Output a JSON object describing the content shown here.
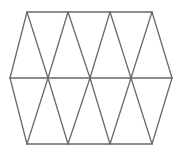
{
  "figure": {
    "canvas": {
      "width": 183,
      "height": 153
    },
    "colors": {
      "background": "#ffffff",
      "stroke": "#6a6a6a",
      "fill": "#ffffff"
    },
    "stroke_width": 1.3,
    "geometry": {
      "rows": {
        "top_y": 12,
        "middle_y": 78,
        "bottom_y": 144
      },
      "top_vertices_x": [
        27,
        68,
        110,
        152
      ],
      "middle_vertices_x": [
        10,
        48,
        90,
        131,
        172
      ],
      "bottom_vertices_x": [
        27,
        68,
        110,
        152
      ]
    },
    "points": {
      "T0": [
        27,
        12
      ],
      "T1": [
        68,
        12
      ],
      "T2": [
        110,
        12
      ],
      "T3": [
        152,
        12
      ],
      "M0": [
        10,
        78
      ],
      "M1": [
        48,
        78
      ],
      "M2": [
        90,
        78
      ],
      "M3": [
        131,
        78
      ],
      "M4": [
        172,
        78
      ],
      "B0": [
        27,
        144
      ],
      "B1": [
        68,
        144
      ],
      "B2": [
        110,
        144
      ],
      "B3": [
        152,
        144
      ]
    },
    "triangles": [
      {
        "name": "top-left-half",
        "pts": "27,12 10,78 48,78"
      },
      {
        "name": "top-up-1",
        "pts": "27,12 48,78 68,12"
      },
      {
        "name": "top-down-1",
        "pts": "68,12 48,78 90,78"
      },
      {
        "name": "top-up-2",
        "pts": "68,12 90,78 110,12"
      },
      {
        "name": "top-down-2",
        "pts": "110,12 90,78 131,78"
      },
      {
        "name": "top-up-3",
        "pts": "110,12 131,78 152,12"
      },
      {
        "name": "top-right-half",
        "pts": "152,12 131,78 172,78"
      },
      {
        "name": "bottom-left-half",
        "pts": "27,144 10,78 48,78"
      },
      {
        "name": "bottom-up-1",
        "pts": "27,144 48,78 68,144"
      },
      {
        "name": "bottom-down-1",
        "pts": "68,144 48,78 90,78"
      },
      {
        "name": "bottom-up-2",
        "pts": "68,144 90,78 110,144"
      },
      {
        "name": "bottom-down-2",
        "pts": "110,144 90,78 131,78"
      },
      {
        "name": "bottom-up-3",
        "pts": "110,144 131,78 152,144"
      },
      {
        "name": "bottom-right-half",
        "pts": "152,144 131,78 172,78"
      }
    ],
    "edges": [
      {
        "name": "outline-top",
        "x1": 27,
        "y1": 12,
        "x2": 152,
        "y2": 12
      },
      {
        "name": "outline-bottom",
        "x1": 27,
        "y1": 144,
        "x2": 152,
        "y2": 144
      },
      {
        "name": "outline-upper-left",
        "x1": 27,
        "y1": 12,
        "x2": 10,
        "y2": 78
      },
      {
        "name": "outline-lower-left",
        "x1": 10,
        "y1": 78,
        "x2": 27,
        "y2": 144
      },
      {
        "name": "outline-upper-right",
        "x1": 152,
        "y1": 12,
        "x2": 172,
        "y2": 78
      },
      {
        "name": "outline-lower-right",
        "x1": 172,
        "y1": 78,
        "x2": 152,
        "y2": 144
      },
      {
        "name": "midline-horizontal",
        "x1": 10,
        "y1": 78,
        "x2": 172,
        "y2": 78
      },
      {
        "name": "top-diag-down-1",
        "x1": 27,
        "y1": 12,
        "x2": 48,
        "y2": 78
      },
      {
        "name": "top-diag-up-1",
        "x1": 48,
        "y1": 78,
        "x2": 68,
        "y2": 12
      },
      {
        "name": "top-diag-down-2",
        "x1": 68,
        "y1": 12,
        "x2": 90,
        "y2": 78
      },
      {
        "name": "top-diag-up-2",
        "x1": 90,
        "y1": 78,
        "x2": 110,
        "y2": 12
      },
      {
        "name": "top-diag-down-3",
        "x1": 110,
        "y1": 12,
        "x2": 131,
        "y2": 78
      },
      {
        "name": "top-diag-up-3",
        "x1": 131,
        "y1": 78,
        "x2": 152,
        "y2": 12
      },
      {
        "name": "bottom-diag-up-1",
        "x1": 27,
        "y1": 144,
        "x2": 48,
        "y2": 78
      },
      {
        "name": "bottom-diag-down-1",
        "x1": 48,
        "y1": 78,
        "x2": 68,
        "y2": 144
      },
      {
        "name": "bottom-diag-up-2",
        "x1": 68,
        "y1": 144,
        "x2": 90,
        "y2": 78
      },
      {
        "name": "bottom-diag-down-2",
        "x1": 90,
        "y1": 78,
        "x2": 110,
        "y2": 144
      },
      {
        "name": "bottom-diag-up-3",
        "x1": 110,
        "y1": 144,
        "x2": 131,
        "y2": 78
      },
      {
        "name": "bottom-diag-down-3",
        "x1": 131,
        "y1": 78,
        "x2": 152,
        "y2": 144
      }
    ],
    "counts": {
      "total_triangles": 14,
      "full_triangles": 10,
      "half_triangles": 4,
      "interior_vertices": 3
    }
  }
}
